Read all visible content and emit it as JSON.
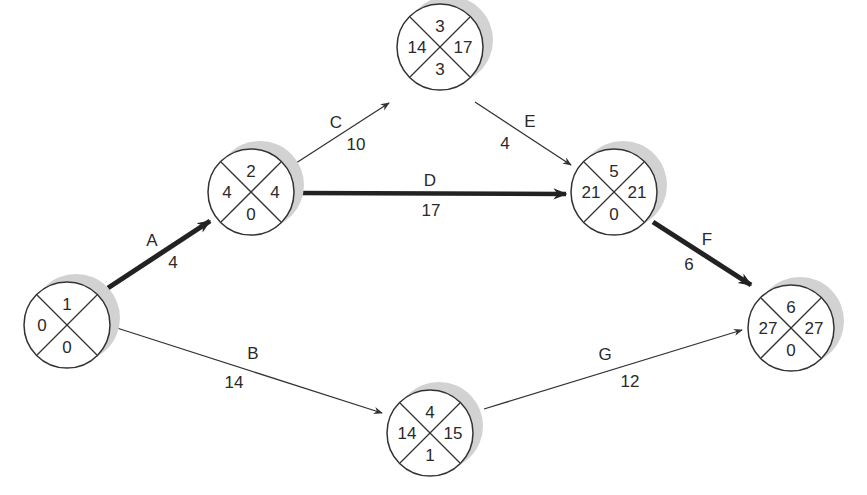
{
  "diagram": {
    "type": "network-diagram",
    "colors": {
      "line": "#333333",
      "shadow": "#cfcfcf",
      "background": "#ffffff",
      "text": "#2a2a2a"
    },
    "node_legend": {
      "top": "node number",
      "left": "earliest time",
      "right": "latest time",
      "bottom": "slack"
    },
    "nodes": [
      {
        "id": "1",
        "top": "1",
        "left": "0",
        "right": "",
        "bottom": "0",
        "x": 67,
        "y": 325
      },
      {
        "id": "2",
        "top": "2",
        "left": "4",
        "right": "4",
        "bottom": "0",
        "x": 251,
        "y": 192
      },
      {
        "id": "3",
        "top": "3",
        "left": "14",
        "right": "17",
        "bottom": "3",
        "x": 440,
        "y": 47
      },
      {
        "id": "4",
        "top": "4",
        "left": "14",
        "right": "15",
        "bottom": "1",
        "x": 440,
        "y": 436
      },
      {
        "id": "5",
        "top": "5",
        "left": "21",
        "right": "21",
        "bottom": "0",
        "x": 614,
        "y": 192
      },
      {
        "id": "6",
        "top": "6",
        "left": "27",
        "right": "27",
        "bottom": "0",
        "x": 790,
        "y": 325
      }
    ],
    "edges": [
      {
        "activity": "A",
        "duration": "4",
        "from": "1",
        "to": "2",
        "critical": true
      },
      {
        "activity": "B",
        "duration": "14",
        "from": "1",
        "to": "4",
        "critical": false
      },
      {
        "activity": "C",
        "duration": "10",
        "from": "2",
        "to": "3",
        "critical": false
      },
      {
        "activity": "D",
        "duration": "17",
        "from": "2",
        "to": "5",
        "critical": true
      },
      {
        "activity": "E",
        "duration": "4",
        "from": "3",
        "to": "5",
        "critical": false
      },
      {
        "activity": "F",
        "duration": "6",
        "from": "5",
        "to": "6",
        "critical": true
      },
      {
        "activity": "G",
        "duration": "12",
        "from": "4",
        "to": "6",
        "critical": false
      }
    ],
    "critical_path": [
      "A",
      "D",
      "F"
    ]
  }
}
